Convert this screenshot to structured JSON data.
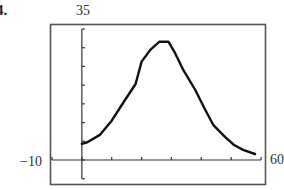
{
  "problem_number": "4.",
  "window": {
    "xmin_label": "−10",
    "xmax_label": "60",
    "ymax_label": "35"
  },
  "chart_data": {
    "type": "line",
    "title": "",
    "xlabel": "",
    "ylabel": "",
    "xlim": [
      -10,
      60
    ],
    "ylim": [
      -5,
      35
    ],
    "x_tick_step": 10,
    "y_tick_step": 5,
    "grid": false,
    "legend": null,
    "annotations": [
      "35",
      "−10",
      "60"
    ],
    "series": [
      {
        "name": "curve",
        "x": [
          0,
          2,
          6,
          10,
          14,
          18,
          20,
          23,
          26,
          29,
          31,
          34,
          38,
          41,
          44,
          48,
          51,
          54,
          58
        ],
        "values": [
          4.3,
          4.8,
          6.7,
          10.5,
          15.5,
          20.3,
          26.3,
          29.5,
          31.6,
          31.6,
          28.9,
          24.0,
          18.7,
          13.9,
          9.4,
          6.1,
          4.0,
          2.7,
          1.6
        ]
      }
    ]
  }
}
